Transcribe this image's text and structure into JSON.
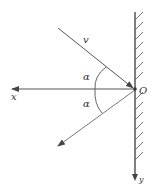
{
  "diagram": {
    "type": "reflection-off-wall",
    "labels": {
      "velocity": "v",
      "angle_incident": "α",
      "angle_reflected": "α",
      "x_axis": "x",
      "y_axis": "y",
      "origin": "O"
    },
    "colors": {
      "line": "#444444",
      "wall": "#555555",
      "background": "#ffffff"
    }
  }
}
